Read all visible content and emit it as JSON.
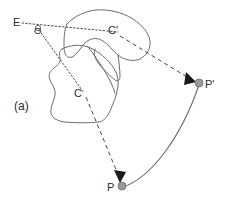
{
  "figure": {
    "panel_label": "(a)",
    "labels": {
      "eye": "E",
      "origin": "O",
      "contour_source": "C",
      "contour_target": "C'",
      "point_source": "P",
      "point_target": "P'"
    },
    "colors": {
      "background": "#ffffff",
      "outline": "#6b6b6b",
      "ray": "#4a4a4a",
      "arrow": "#1a1a1a",
      "point_fill": "#9a9a9a",
      "text": "#2a2a2a"
    },
    "elements": {
      "blob_source_name": "contour-C",
      "blob_target_name": "contour-C-prime",
      "ray_eye_to_target_name": "dotted-ray-E-to-C-prime",
      "ray_origin_to_source_name": "dotted-ray-O-to-C",
      "arrow_to_point_target_name": "dashed-arrow-to-P-prime",
      "arrow_to_point_source_name": "dashed-arrow-to-P",
      "arc_name": "curved-trajectory-P-to-P-prime"
    },
    "geometry": {
      "eye_label_xy": [
        13,
        22
      ],
      "origin_xy": [
        38,
        28
      ],
      "point_source_xy": [
        122,
        186
      ],
      "point_target_xy": [
        199,
        83
      ],
      "contour_source_label_xy": [
        76,
        95
      ],
      "contour_target_label_xy": [
        112,
        33
      ]
    }
  }
}
